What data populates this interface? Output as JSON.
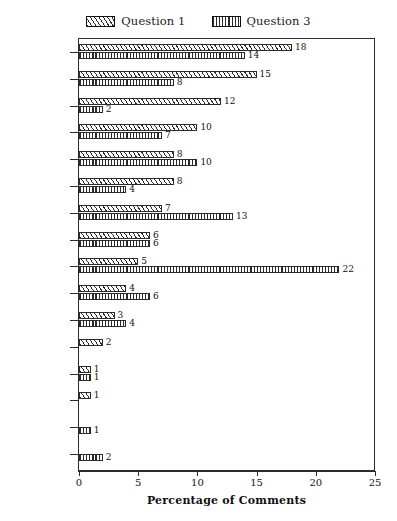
{
  "chart_data": {
    "type": "bar",
    "orientation": "horizontal",
    "title": "",
    "xlabel": "Percentage of Comments",
    "ylabel": "",
    "xlim": [
      0,
      25
    ],
    "xticks": [
      0,
      5,
      10,
      15,
      20,
      25
    ],
    "grid": false,
    "legend_position": "top-center",
    "categories": [
      "Tenses",
      "Oral",
      "Nothing/\nblank",
      "Listening",
      "General\nGrammar",
      "Reading",
      "Vocabulary",
      "Writing",
      "Cases",
      "Word Order",
      "Translation",
      "Topics",
      "Literature",
      "Everything",
      "Study Skills",
      "Personal/\naffective"
    ],
    "series": [
      {
        "name": "Question 1",
        "pattern": "diagonal-hatch",
        "values": [
          18,
          15,
          12,
          10,
          8,
          8,
          7,
          6,
          5,
          4,
          3,
          2,
          1,
          1,
          null,
          null
        ]
      },
      {
        "name": "Question 3",
        "pattern": "vertical-hatch",
        "values": [
          14,
          8,
          2,
          7,
          10,
          4,
          13,
          6,
          22,
          6,
          4,
          null,
          1,
          null,
          1,
          2
        ]
      }
    ]
  },
  "legend": {
    "entries": [
      {
        "label": "Question 1",
        "pattern": "diagonal-hatch"
      },
      {
        "label": "Question 3",
        "pattern": "vertical-hatch"
      }
    ]
  },
  "axis": {
    "x_title": "Percentage of Comments",
    "x_tick_labels": [
      "0",
      "5",
      "10",
      "15",
      "20",
      "25"
    ]
  }
}
